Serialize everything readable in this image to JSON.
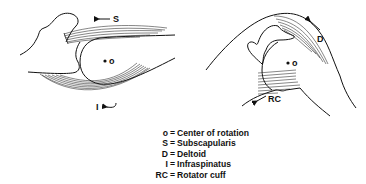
{
  "figures": [
    {
      "id": "left",
      "labels": {
        "center": "o",
        "top_muscle": "S",
        "bottom_muscle": "I"
      }
    },
    {
      "id": "right",
      "labels": {
        "center": "o",
        "top_muscle": "D",
        "bottom_muscle": "RC"
      }
    }
  ],
  "legend": [
    {
      "key": "o",
      "eq": "=",
      "value": "Center of rotation"
    },
    {
      "key": "S",
      "eq": "=",
      "value": "Subscapularis"
    },
    {
      "key": "D",
      "eq": "=",
      "value": "Deltoid"
    },
    {
      "key": "I",
      "eq": "=",
      "value": "Infraspinatus"
    },
    {
      "key": "RC",
      "eq": "=",
      "value": "Rotator cuff"
    }
  ]
}
